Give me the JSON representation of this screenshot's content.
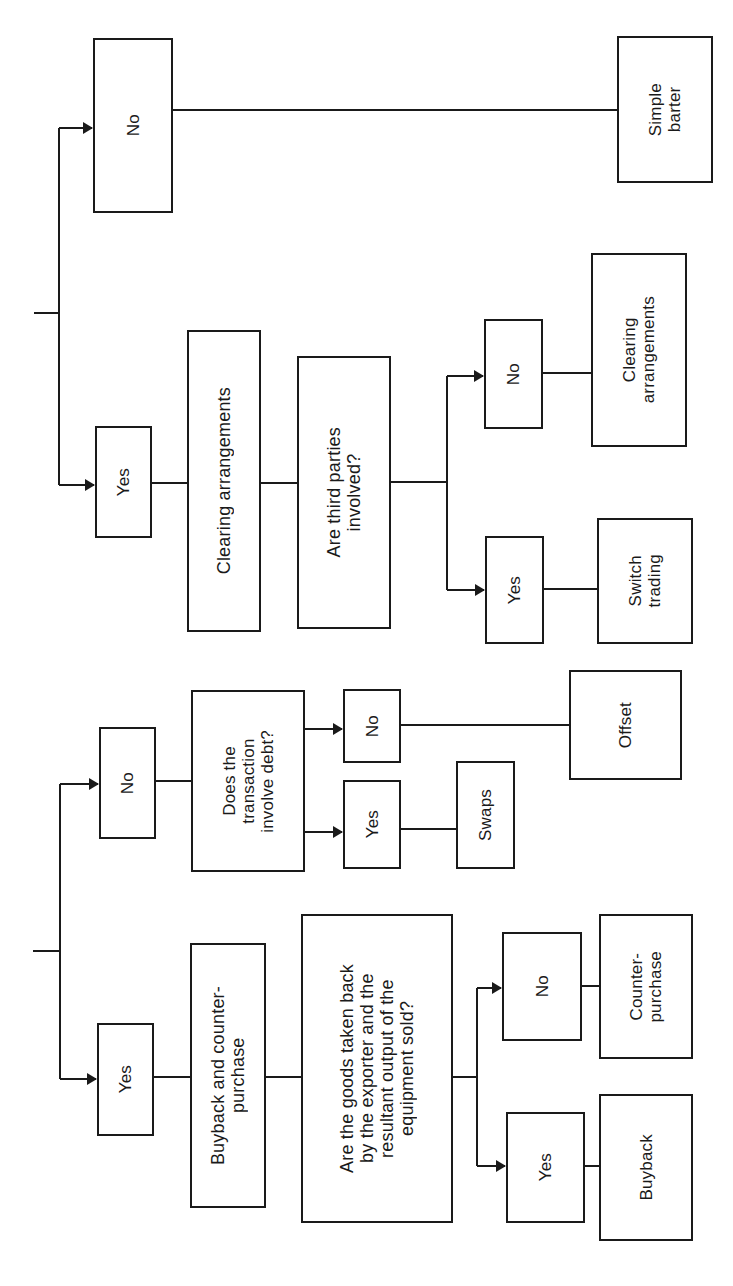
{
  "diagram": {
    "orientation": "rotated-90-ccw",
    "line_color": "#1a1a1a",
    "background": "#ffffff",
    "top_tree": {
      "no_branch": {
        "label": "No",
        "outcome": "Simple\nbarter"
      },
      "yes_branch": {
        "label": "Yes",
        "category": "Clearing arrangements",
        "question": "Are third\nparties\ninvolved?",
        "question_display": "Are third parties\ninvolved?",
        "no": {
          "label": "No",
          "outcome": "Clearing\narrangements"
        },
        "yes": {
          "label": "Yes",
          "outcome": "Switch\ntrading"
        }
      }
    },
    "bottom_tree": {
      "no_branch": {
        "label": "No",
        "question": "Does the\ntransaction\ninvolve debt?",
        "no": {
          "label": "No",
          "outcome": "Offset"
        },
        "yes": {
          "label": "Yes",
          "outcome": "Swaps"
        }
      },
      "yes_branch": {
        "label": "Yes",
        "category": "Buyback and counter-\npurchase",
        "question": "Are the goods taken back\nby the exporter and the\nresultant output of the\nequipment sold?",
        "no": {
          "label": "No",
          "outcome": "Counter-\npurchase"
        },
        "yes": {
          "label": "Yes",
          "outcome": "Buyback"
        }
      }
    }
  }
}
